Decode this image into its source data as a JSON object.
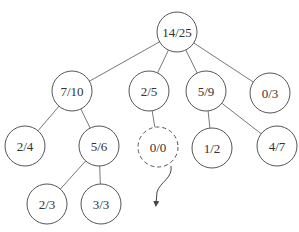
{
  "diagram": {
    "type": "tree",
    "colors": {
      "stroke": "#555555",
      "text": "#333333",
      "background": "#ffffff"
    },
    "nodes": [
      {
        "id": "root",
        "label": "14/25",
        "x": 177,
        "y": 32,
        "dashed": false
      },
      {
        "id": "n1",
        "label": "7/10",
        "x": 72,
        "y": 91,
        "dashed": false
      },
      {
        "id": "n2",
        "label": "2/5",
        "x": 149,
        "y": 91,
        "dashed": false
      },
      {
        "id": "n3",
        "label": "5/9",
        "x": 206,
        "y": 91,
        "dashed": false
      },
      {
        "id": "n4",
        "label": "0/3",
        "x": 270,
        "y": 93,
        "dashed": false
      },
      {
        "id": "n5",
        "label": "2/4",
        "x": 25,
        "y": 146,
        "dashed": false
      },
      {
        "id": "n6",
        "label": "5/6",
        "x": 99,
        "y": 146,
        "dashed": false
      },
      {
        "id": "n7",
        "label": "0/0",
        "x": 158,
        "y": 147,
        "dashed": true
      },
      {
        "id": "n8",
        "label": "1/2",
        "x": 212,
        "y": 148,
        "dashed": false
      },
      {
        "id": "n9",
        "label": "4/7",
        "x": 277,
        "y": 146,
        "dashed": false
      },
      {
        "id": "n10",
        "label": "2/3",
        "x": 47,
        "y": 204,
        "dashed": false
      },
      {
        "id": "n11",
        "label": "3/3",
        "x": 101,
        "y": 204,
        "dashed": false
      }
    ],
    "edges": [
      [
        "root",
        "n1"
      ],
      [
        "root",
        "n2"
      ],
      [
        "root",
        "n3"
      ],
      [
        "root",
        "n4"
      ],
      [
        "n1",
        "n5"
      ],
      [
        "n1",
        "n6"
      ],
      [
        "n2",
        "n7"
      ],
      [
        "n3",
        "n8"
      ],
      [
        "n3",
        "n9"
      ],
      [
        "n6",
        "n10"
      ],
      [
        "n6",
        "n11"
      ]
    ],
    "node_radius": 20,
    "simulation_arrow": {
      "from_node": "n7",
      "path": "M171,166 C173,178 160,182 157,192 L156,204"
    }
  }
}
